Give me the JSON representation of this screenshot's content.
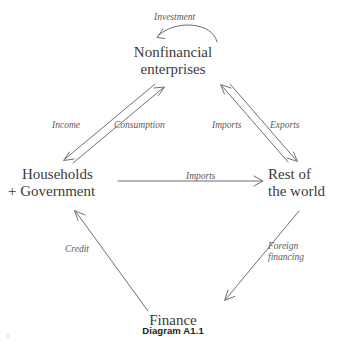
{
  "diagram": {
    "caption": "Diagram A1.1",
    "colors": {
      "node_text": "#3b3b3b",
      "edge_label_text": "#5a5a5a",
      "arrow_stroke": "#5f5f5f",
      "caption_text": "#1c1c1c",
      "background": "#ffffff"
    },
    "nodes": [
      {
        "id": "enterprises",
        "lines": [
          "Nonfinancial",
          "enterprises"
        ]
      },
      {
        "id": "households",
        "lines": [
          "Households",
          "+ Government"
        ]
      },
      {
        "id": "rest_of_world",
        "lines": [
          "Rest of",
          "the world"
        ]
      },
      {
        "id": "finance",
        "lines": [
          "Finance"
        ]
      }
    ],
    "edges": [
      {
        "id": "investment",
        "label": "Investment",
        "from": "enterprises",
        "to": "enterprises",
        "shape": "curved-loop",
        "direction": "down-left"
      },
      {
        "id": "income",
        "label": "Income",
        "from": "enterprises",
        "to": "households",
        "shape": "straight",
        "direction": "down-left"
      },
      {
        "id": "consumption",
        "label": "Consumption",
        "from": "households",
        "to": "enterprises",
        "shape": "straight",
        "direction": "up-right"
      },
      {
        "id": "imports_right",
        "label": "Imports",
        "from": "rest_of_world",
        "to": "enterprises",
        "shape": "straight",
        "direction": "up-left"
      },
      {
        "id": "exports",
        "label": "Exports",
        "from": "enterprises",
        "to": "rest_of_world",
        "shape": "straight",
        "direction": "down-right"
      },
      {
        "id": "imports_middle",
        "label": "Imports",
        "from": "households",
        "to": "rest_of_world",
        "shape": "straight",
        "direction": "right"
      },
      {
        "id": "credit",
        "label": "Credit",
        "from": "finance",
        "to": "households",
        "shape": "straight",
        "direction": "up-left"
      },
      {
        "id": "foreign_financing",
        "label_lines": [
          "Foreign",
          "financing"
        ],
        "from": "rest_of_world",
        "to": "finance",
        "shape": "straight",
        "direction": "down-left"
      }
    ]
  }
}
